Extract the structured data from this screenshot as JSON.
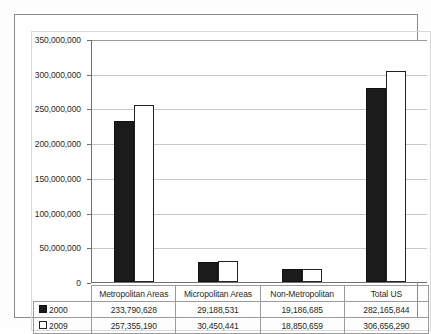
{
  "chart_data": {
    "type": "bar",
    "title": "",
    "xlabel": "",
    "ylabel": "",
    "categories": [
      "Metropolitan Areas",
      "Micropolitan Areas",
      "Non-Metropolitan",
      "Total US"
    ],
    "series": [
      {
        "name": "2000",
        "marker": "filled-square",
        "color": "#1b1b1b",
        "values": [
          233790628,
          29188531,
          19186685,
          282165844
        ],
        "labels": [
          "233,790,628",
          "29,188,531",
          "19,186,685",
          "282,165,844"
        ]
      },
      {
        "name": "2009",
        "marker": "hollow-square",
        "color": "#ffffff",
        "values": [
          257355190,
          30450441,
          18850659,
          306656290
        ],
        "labels": [
          "257,355,190",
          "30,450,441",
          "18,850,659",
          "306,656,290"
        ]
      }
    ],
    "ylim": [
      0,
      350000000
    ],
    "ytick_values": [
      0,
      50000000,
      100000000,
      150000000,
      200000000,
      250000000,
      300000000,
      350000000
    ],
    "ytick_labels": [
      "0",
      "50,000,000",
      "100,000,000",
      "150,000,000",
      "200,000,000",
      "250,000,000",
      "300,000,000",
      "350,000,000"
    ],
    "grid": true,
    "legend_position": "data-table-left-column",
    "has_data_table": true
  },
  "data_table": {
    "column_headers": [
      "Metropolitan Areas",
      "Micropolitan Areas",
      "Non-Metropolitan",
      "Total US"
    ],
    "rows": [
      {
        "label": "2000",
        "marker": "filled-square",
        "cells": [
          "233,790,628",
          "29,188,531",
          "19,186,685",
          "282,165,844"
        ]
      },
      {
        "label": "2009",
        "marker": "hollow-square",
        "cells": [
          "257,355,190",
          "30,450,441",
          "18,850,659",
          "306,656,290"
        ]
      }
    ]
  },
  "colors": {
    "series_2000": "#1b1b1b",
    "series_2009": "#ffffff",
    "axis": "#6f6f6f",
    "gridline": "#c8c8c8",
    "frame": "#8a8a8a"
  }
}
